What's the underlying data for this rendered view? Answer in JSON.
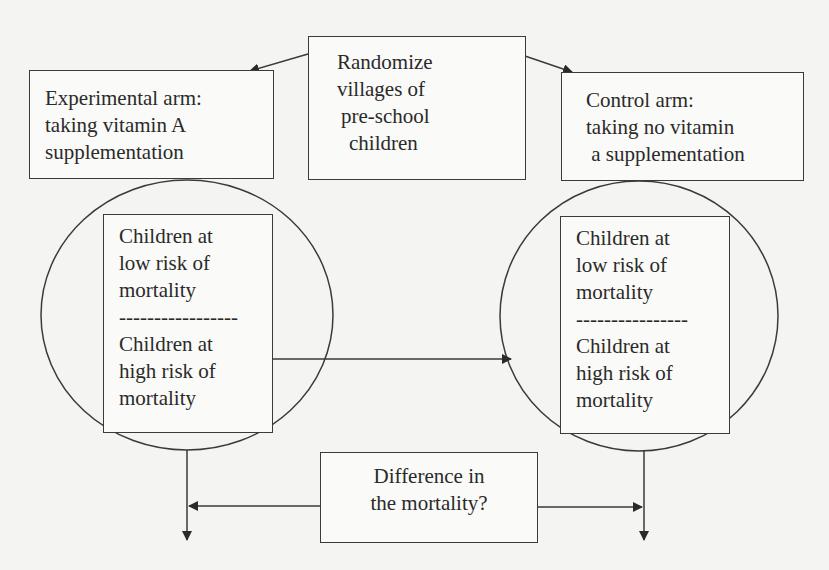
{
  "diagram": {
    "root": {
      "lines": [
        "Randomize",
        "villages of",
        "pre-school",
        "children"
      ]
    },
    "experimental_arm": {
      "lines": [
        "Experimental arm:",
        "taking vitamin A",
        "supplementation"
      ]
    },
    "control_arm": {
      "lines": [
        "Control arm:",
        "taking no vitamin",
        " a supplementation"
      ]
    },
    "experimental_group": {
      "low_risk": [
        "Children at",
        "low risk of",
        "mortality"
      ],
      "separator": "-----------------",
      "high_risk": [
        "Children at",
        "high risk of",
        "mortality"
      ]
    },
    "control_group": {
      "low_risk": [
        "Children at",
        "low risk of",
        "mortality"
      ],
      "separator": "----------------",
      "high_risk": [
        "Children at",
        "high risk of",
        "mortality"
      ]
    },
    "outcome": {
      "lines": [
        "Difference in",
        "the mortality?"
      ]
    },
    "colors": {
      "background": "#f4f4f2",
      "stroke": "#3a3a3a",
      "text": "#2a2a2a"
    }
  }
}
